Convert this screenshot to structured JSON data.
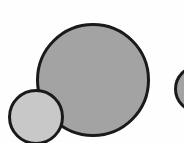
{
  "diagram": {
    "background": "#fefefe",
    "circles": [
      {
        "id": "large-circle",
        "cx": 92.5,
        "cy": 80,
        "diameter": 114,
        "fill": "#a3a3a3",
        "stroke": "#1a1a1a",
        "stroke_width": 3
      },
      {
        "id": "small-circle",
        "cx": 36,
        "cy": 117,
        "diameter": 56,
        "fill": "#c8c8c8",
        "stroke": "#1a1a1a",
        "stroke_width": 3
      },
      {
        "id": "partial-right-circle",
        "cx": 198,
        "cy": 89,
        "diameter": 48,
        "fill": "#a3a3a3",
        "stroke": "#1a1a1a",
        "stroke_width": 3
      }
    ]
  }
}
